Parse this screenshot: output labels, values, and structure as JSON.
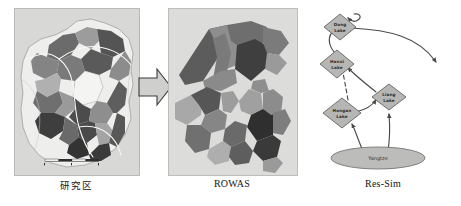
{
  "figure": {
    "background_color": "#ffffff",
    "panel_count": 3
  },
  "panels": [
    {
      "id": "study-area",
      "caption": "研究区",
      "kind": "raster-map",
      "background_color": "#d8d8d6",
      "description": "Grayscale administrative/watershed map with shaded regions, river lines and a scale bar"
    },
    {
      "id": "rowas",
      "caption": "ROWAS",
      "kind": "polygon-map",
      "background_color": "#dcdcda",
      "description": "Abstracted grayscale polygons representing aggregated water allocation units"
    },
    {
      "id": "res-sim",
      "caption": "Res-Sim",
      "kind": "network-diagram",
      "background_color": "#ffffff",
      "description": "Reservoir simulation node-link network of lakes connected to the Yangtze"
    }
  ],
  "flow_arrow": {
    "direction": "right",
    "fill": "#cfcfcd",
    "stroke": "#3a3a3a"
  },
  "network": {
    "nodes": [
      {
        "id": "dong",
        "label_line1": "Dong",
        "label_line2": "Lake",
        "shape": "diamond",
        "fill": "#b6b6b4"
      },
      {
        "id": "hanxi",
        "label_line1": "Hanxi",
        "label_line2": "Lake",
        "shape": "diamond",
        "fill": "#b6b6b4"
      },
      {
        "id": "liang",
        "label_line1": "Liang",
        "label_line2": "Lake",
        "shape": "diamond",
        "fill": "#b6b6b4"
      },
      {
        "id": "hongan",
        "label_line1": "Hongan",
        "label_line2": "Lake",
        "shape": "diamond",
        "fill": "#b6b6b4"
      },
      {
        "id": "yangtze",
        "label_line1": "Yangtze",
        "shape": "ellipse",
        "fill": "#bcbcba"
      }
    ],
    "links": [
      {
        "from": "yangtze",
        "to": "hongan",
        "style": "solid"
      },
      {
        "from": "yangtze",
        "to": "liang",
        "style": "solid"
      },
      {
        "from": "hongan",
        "to": "liang",
        "style": "solid"
      },
      {
        "from": "hongan",
        "to": "hanxi",
        "style": "dashed"
      },
      {
        "from": "liang",
        "to": "hanxi",
        "style": "solid"
      },
      {
        "from": "hanxi",
        "to": "dong",
        "style": "solid"
      },
      {
        "from": "dong",
        "to": "outlet-right",
        "style": "solid"
      },
      {
        "from": "dong",
        "to": "inflow-top",
        "style": "solid"
      }
    ],
    "line_color": "#4a4a4a",
    "node_stroke": "#555553"
  },
  "map_regions": {
    "shades": [
      "#3c3c3c",
      "#545454",
      "#6b6b6b",
      "#848484",
      "#9c9c9c",
      "#b4b4b4",
      "#cfcfcf",
      "#eaeaea"
    ],
    "river_color": "#f2f2f0",
    "border_color": "#6e6e6c"
  },
  "rowas_polygons": {
    "shades": [
      "#474747",
      "#5c5c5c",
      "#707070",
      "#8a8a8a",
      "#a2a2a2",
      "#bcbcbc",
      "#9a9a9a"
    ]
  },
  "scalebar": {
    "present": true,
    "color": "#2e2e2e"
  }
}
